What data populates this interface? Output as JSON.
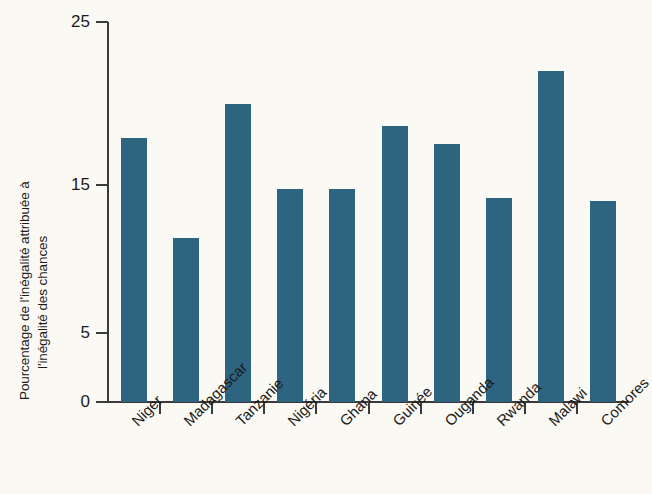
{
  "chart_data": {
    "type": "bar",
    "title": "",
    "subtitle": "",
    "xlabel": "",
    "ylabel": "Pourcentage de l'inégalité attribuée à l'inégalité des chances",
    "ylabel_lines": [
      "Pourcentage de l'inégalité attribuée à",
      "l'inégalité des chances"
    ],
    "categories": [
      "Niger",
      "Madagascar",
      "Tanzanie",
      "Nigéria",
      "Ghana",
      "Guinée",
      "Ouganda",
      "Rwanda",
      "Malawi",
      "Comores"
    ],
    "values": [
      17.9,
      11.4,
      20.0,
      14.7,
      14.7,
      18.6,
      17.5,
      14.1,
      22.0,
      13.9
    ],
    "ylim": [
      0,
      25
    ],
    "ytick_values": [
      0,
      5,
      15,
      25
    ],
    "ytick_labels": [
      "0",
      "5",
      "15",
      "25"
    ],
    "grid": false,
    "legend": null,
    "bar_color": "#2d6480",
    "background_color": "#fbf9f3",
    "axis_color": "#3a3a38",
    "text_color": "#1b1b1b"
  },
  "figure": {
    "name": "bar-chart-inegalite-chances"
  }
}
